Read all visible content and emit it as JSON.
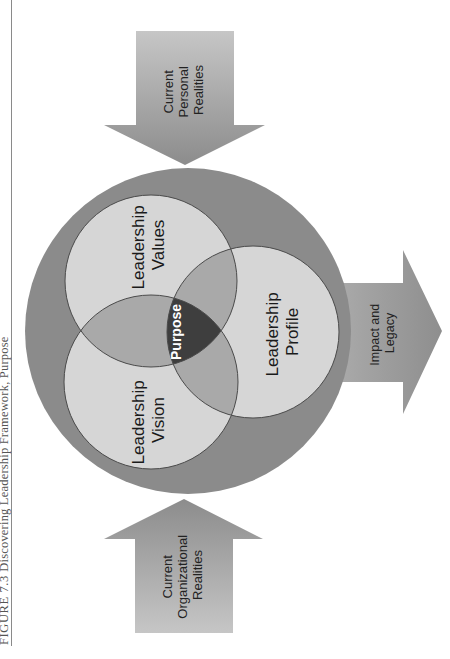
{
  "caption": {
    "figure_label": "FIGURE 7.3",
    "title": "Discovering Leadership Framework, Purpose"
  },
  "arrows": {
    "top": {
      "lines": [
        "Current",
        "Personal",
        "Realities"
      ],
      "direction": "down"
    },
    "bottom": {
      "lines": [
        "Current",
        "Organizational",
        "Realities"
      ],
      "direction": "up"
    },
    "right": {
      "lines": [
        "Impact and",
        "Legacy"
      ],
      "direction": "right"
    }
  },
  "circles": {
    "values": {
      "lines": [
        "Leadership",
        "Values"
      ]
    },
    "vision": {
      "lines": [
        "Leadership",
        "Vision"
      ]
    },
    "profile": {
      "lines": [
        "Leadership",
        "Profile"
      ]
    },
    "center": {
      "label": "Purpose"
    }
  },
  "colors": {
    "outer_ring": "#8b8b8b",
    "circle_fill": "#d6d6d6",
    "double_overlap": "#a9a9a9",
    "triple_overlap": "#3e3e3e",
    "arrow_light": "#c4c4c4",
    "arrow_dark": "#8e8e8e",
    "stroke": "#4a4a4a"
  }
}
